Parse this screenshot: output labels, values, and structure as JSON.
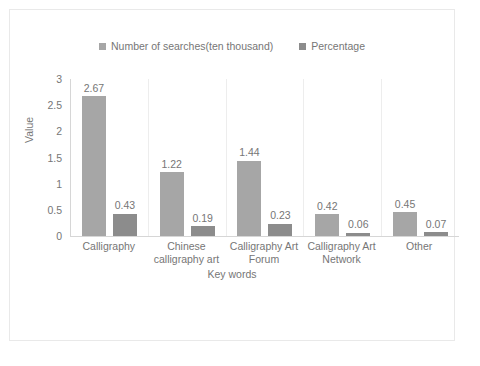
{
  "chart_data": {
    "type": "bar",
    "title": "",
    "xlabel": "Key words",
    "ylabel": "Value",
    "categories": [
      "Calligraphy",
      "Chinese calligraphy art",
      "Calligraphy Art Forum",
      "Calligraphy Art Network",
      "Other"
    ],
    "series": [
      {
        "name": "Number of searches(ten thousand)",
        "color": "#a6a6a6",
        "values": [
          2.67,
          1.22,
          1.44,
          0.42,
          0.45
        ],
        "labels": [
          "2.67",
          "1.22",
          "1.44",
          "0.42",
          "0.45"
        ]
      },
      {
        "name": "Percentage",
        "color": "#8c8c8c",
        "values": [
          0.43,
          0.19,
          0.23,
          0.06,
          0.07
        ],
        "labels": [
          "0.43",
          "0.19",
          "0.23",
          "0.06",
          "0.07"
        ]
      }
    ],
    "ylim": [
      0,
      3
    ],
    "yticks": [
      3,
      2.5,
      2,
      1.5,
      1,
      0.5,
      0
    ],
    "ytick_labels": [
      "3",
      "2.5",
      "2",
      "1.5",
      "1",
      "0.5",
      "0"
    ],
    "grid": false,
    "legend_position": "top"
  },
  "legend": {
    "entries": [
      {
        "label": "Number of searches(ten thousand)",
        "swatch": "legend-swatch-series-1"
      },
      {
        "label": "Percentage",
        "swatch": "legend-swatch-series-2"
      }
    ]
  },
  "colors": {
    "series_1": "#a6a6a6",
    "series_2": "#8c8c8c",
    "axis": "#d6d6d6",
    "separator": "#ededed",
    "frame": "#e9e9e9",
    "text": "#767676"
  }
}
